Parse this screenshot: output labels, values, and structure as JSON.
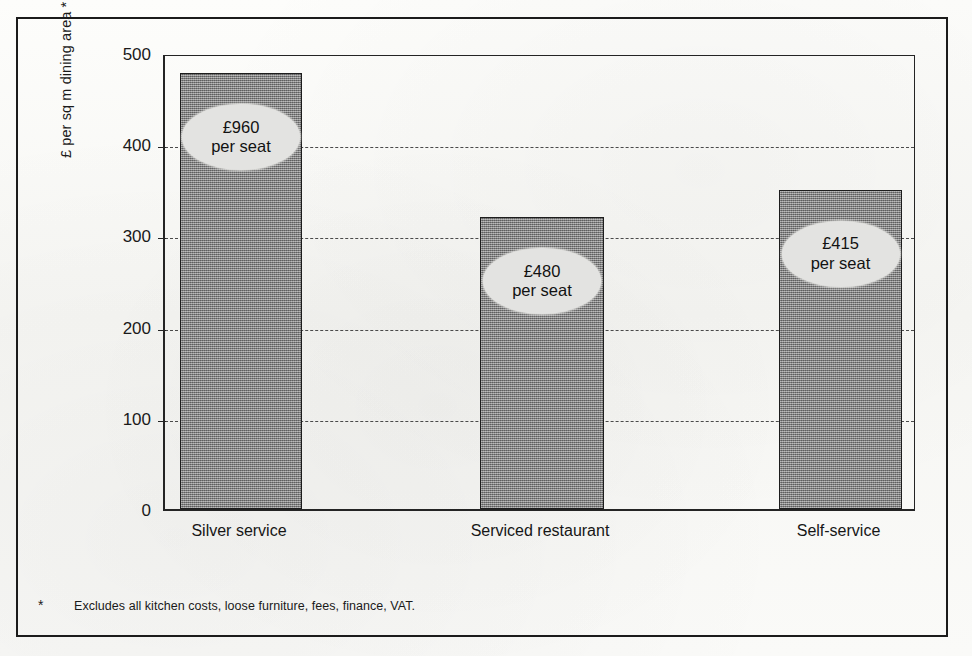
{
  "chart_data": {
    "type": "bar",
    "title": "",
    "subtitle": "",
    "xlabel": "",
    "ylabel": "£ per sq m dining area *",
    "ylim": [
      0,
      500
    ],
    "ytick_values": [
      500,
      400,
      300,
      200,
      100,
      0
    ],
    "ytick_labels": [
      "500",
      "400",
      "300",
      "200",
      "100",
      "0"
    ],
    "grid": true,
    "grid_axis": "y",
    "grid_style": "dashed",
    "legend": false,
    "categories": [
      "Silver service",
      "Serviced restaurant",
      "Self-service"
    ],
    "values": [
      478,
      320,
      350
    ],
    "annotations": [
      {
        "amount": "£960",
        "unit": "per seat",
        "category": "Silver service"
      },
      {
        "amount": "£480",
        "unit": "per seat",
        "category": "Serviced restaurant"
      },
      {
        "amount": "£415",
        "unit": "per seat",
        "category": "Self-service"
      }
    ],
    "footnote_marker": "*",
    "footnote": "Excludes all kitchen costs, loose furniture, fees, finance, VAT.",
    "colors": {
      "bar_fill": "#8a8a8a",
      "bar_border": "#1d1d1d",
      "callout_fill": "#e3e3e1",
      "axis": "#242424",
      "grid": "#4a4a4a",
      "text": "#1a1a1a",
      "frame": "#1b1b1b",
      "background": "#fbfbf9"
    }
  },
  "axis": {
    "ticks": [
      {
        "label": "500",
        "value": 500
      },
      {
        "label": "400",
        "value": 400
      },
      {
        "label": "300",
        "value": 300
      },
      {
        "label": "200",
        "value": 200
      },
      {
        "label": "100",
        "value": 100
      },
      {
        "label": "0",
        "value": 0
      }
    ],
    "y_title": "£ per sq m dining area *"
  },
  "bars": [
    {
      "category": "Silver service",
      "value": 478,
      "amount": "£960",
      "unit": "per seat"
    },
    {
      "category": "Serviced restaurant",
      "value": 320,
      "amount": "£480",
      "unit": "per seat"
    },
    {
      "category": "Self-service",
      "value": 350,
      "amount": "£415",
      "unit": "per seat"
    }
  ],
  "footnote": {
    "marker": "*",
    "text": "Excludes all kitchen costs, loose furniture, fees, finance, VAT."
  }
}
